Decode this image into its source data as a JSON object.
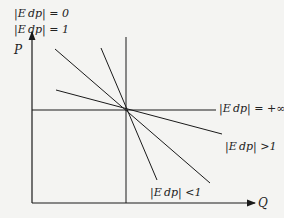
{
  "diagram": {
    "axes": {
      "y_label": "P",
      "x_label": "Q"
    },
    "labels": {
      "zero": "|E_dp| = 0",
      "one": "|E_dp| = 1",
      "infinite": "|E_dp| = +∞",
      "greater": "|E_dp| > 1",
      "less": "|E_dp| < 1"
    },
    "display": {
      "zero": "|E dp| = 0",
      "one": "|E dp| = 1",
      "infinite": "|E dp| = +∞",
      "greater": "|E dp| >1",
      "less": "|E dp| <1"
    },
    "colors": {
      "line": "#1a1a1a",
      "background": "#f4f4f2"
    }
  }
}
